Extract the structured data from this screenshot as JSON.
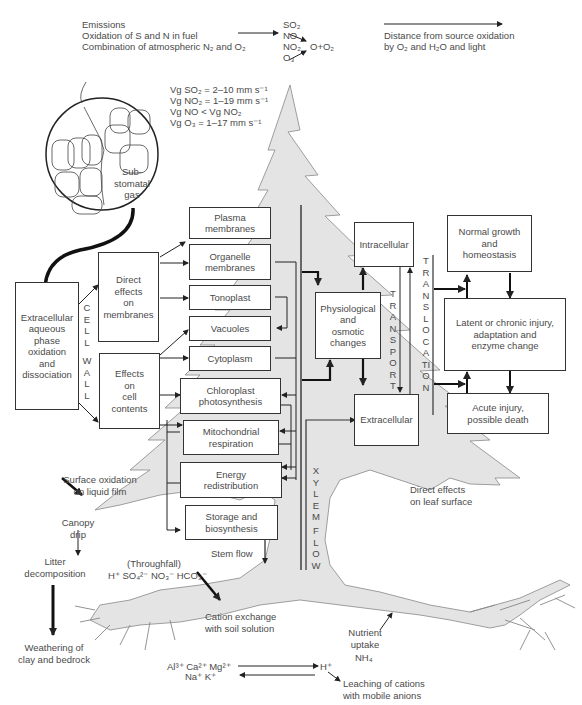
{
  "top": {
    "emissions_lines": [
      "Emissions",
      "Oxidation of S and N in fuel",
      "Combination of atmospheric N₂ and O₂"
    ],
    "pollutants": [
      "SO₂",
      "NO",
      "NO₂",
      "O₃"
    ],
    "product": "O+O₂",
    "distance_lines": [
      "Distance from source oxidation",
      "by O₂ and H₂O and light"
    ]
  },
  "deposition_velocities": [
    "Vg SO₂ = 2–10 mm s⁻¹",
    "Vg NO₂ = 1–19 mm s⁻¹",
    "Vg NO < Vg NO₂",
    "Vg O₃ = 1–17 mm s⁻¹"
  ],
  "stomata": {
    "label": "Sub-\nstomatal\ngas"
  },
  "boxes": {
    "extracellular_aqueous": "Extracellular\naqueous\nphase\noxidation\nand\ndissociation",
    "direct_effects": "Direct\neffects\non\nmembranes",
    "effects_cell": "Effects\non\ncell\ncontents",
    "plasma": "Plasma\nmembranes",
    "organelle": "Organelle\nmembranes",
    "tonoplast": "Tonoplast",
    "vacuoles": "Vacuoles",
    "cytoplasm": "Cytoplasm",
    "chloroplast": "Chloroplast\nphotosynthesis",
    "mitochondrial": "Mitochondrial\nrespiration",
    "energy": "Energy\nredistribution",
    "storage": "Storage and\nbiosynthesis",
    "physiological": "Physiological\nand\nosmotic\nchanges",
    "intracellular": "Intracellular",
    "extracellular": "Extracellular",
    "normal_growth": "Normal growth\nand\nhomeostasis",
    "latent": "Latent or chronic injury,\nadaptation and\nenzyme change",
    "acute": "Acute injury,\npossible death"
  },
  "vertical_labels": {
    "cell": "CELL",
    "wall": "WALL",
    "transport": "TRANSPORT",
    "translocation": "TRANSLOCATION",
    "xylem": "XYLEM",
    "flow": "FLOW"
  },
  "annotations": {
    "surface_oxidation": "Surface oxidation\non liquid film",
    "canopy_drip": "Canopy\ndrip",
    "litter": "Litter\ndecomposition",
    "weathering": "Weathering of\nclay and bedrock",
    "stem_flow": "Stem flow",
    "throughfall": "(Throughfall)",
    "throughfall_ions": "H⁺  SO₄²⁻  NO₃⁻ HCO₃⁻",
    "cation_exchange": "Cation exchange\nwith soil solution",
    "direct_leaf": "Direct effects\non leaf surface",
    "nutrient_uptake": "Nutrient\nuptake",
    "nh4": "NH₄",
    "cations_top": "Al³⁺  Ca²⁺  Mg²⁺",
    "cations_bottom": "Na⁺  K⁺",
    "h_plus": "H⁺",
    "leaching": "Leaching of cations\nwith mobile anions"
  },
  "colors": {
    "tree_fill": "#e4e4e4",
    "tree_stroke": "#777777",
    "box_stroke": "#333333",
    "text": "#4a4a4a"
  }
}
